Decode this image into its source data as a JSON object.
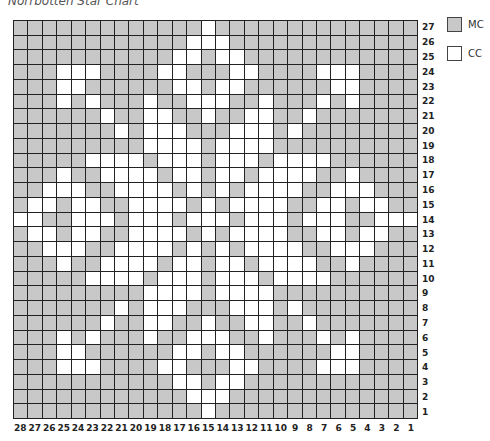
{
  "title": "Norrbotten Star Chart",
  "colors": {
    "mc": "#c8c8c8",
    "cc": "#ffffff",
    "grid": "#222222"
  },
  "legend": [
    {
      "key": "mc",
      "label": "MC"
    },
    {
      "key": "cc",
      "label": "CC"
    }
  ],
  "chart_data": {
    "type": "heatmap",
    "title": "Norrbotten Star Chart",
    "columns": 28,
    "rows": 27,
    "x_tick_labels": [
      28,
      27,
      26,
      25,
      24,
      23,
      22,
      21,
      20,
      19,
      18,
      17,
      16,
      15,
      14,
      13,
      12,
      11,
      10,
      9,
      8,
      7,
      6,
      5,
      4,
      3,
      2,
      1
    ],
    "y_tick_labels": [
      27,
      26,
      25,
      24,
      23,
      22,
      21,
      20,
      19,
      18,
      17,
      16,
      15,
      14,
      13,
      12,
      11,
      10,
      9,
      8,
      7,
      6,
      5,
      4,
      3,
      2,
      1
    ],
    "legend": {
      "MC": "gray",
      "CC": "white"
    },
    "symmetry": "left half (grid cols 0-13 from left) mirrored around col 13; rows mirrored around row 14",
    "cc_cells_left_half_by_row": {
      "27": [
        13
      ],
      "26": [
        12,
        13
      ],
      "25": [
        11,
        12
      ],
      "24": [
        3,
        4,
        5,
        10,
        11
      ],
      "23": [
        3,
        4,
        11,
        12
      ],
      "22": [
        3,
        5,
        9,
        12,
        13
      ],
      "21": [
        6,
        9,
        10,
        13
      ],
      "20": [
        7,
        9,
        10,
        11
      ],
      "19": [
        9,
        10,
        11,
        12
      ],
      "18": [
        5,
        6,
        7,
        8,
        10,
        11,
        12
      ],
      "17": [
        3,
        6,
        7,
        8,
        9,
        11,
        12
      ],
      "16": [
        2,
        3,
        4,
        7,
        8,
        9,
        10,
        12
      ],
      "15": [
        1,
        2,
        4,
        5,
        8,
        9,
        10,
        11,
        13
      ],
      "14": [
        0,
        1,
        4,
        5,
        6,
        8,
        9,
        10,
        12,
        13
      ]
    }
  }
}
